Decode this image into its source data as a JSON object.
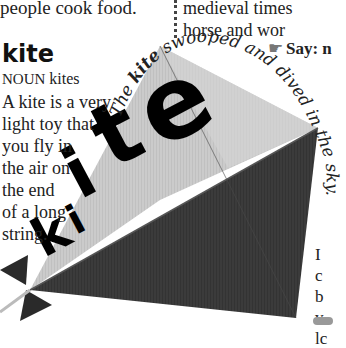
{
  "page": {
    "previous_entry_tail": "people cook food.",
    "entry": {
      "headword": "kite",
      "part_of_speech": "NOUN",
      "plural": "kites",
      "definition_lines": [
        "A kite is a very",
        "light toy that",
        "you fly in",
        "the air on",
        "the end",
        "of a long",
        "string."
      ]
    },
    "illustration": {
      "subject": "kite",
      "big_label": "kite",
      "caption": "The kite swooped and dived in the sky.",
      "caption_parts": {
        "lead": "The ",
        "highlight": "kite",
        "rest": " swooped and dived in the sky."
      },
      "colors": {
        "light_sail": "#c9c9c9",
        "dark_sail": "#3a3a3a",
        "tail_bow": "#2a2a2a",
        "label": "#000000"
      }
    },
    "right_column": {
      "lines": [
        "medieval times",
        "horse and wor"
      ],
      "say_label": "Say: n",
      "fragment_lines": [
        "I",
        "c",
        "b",
        "v",
        "lc"
      ]
    }
  }
}
